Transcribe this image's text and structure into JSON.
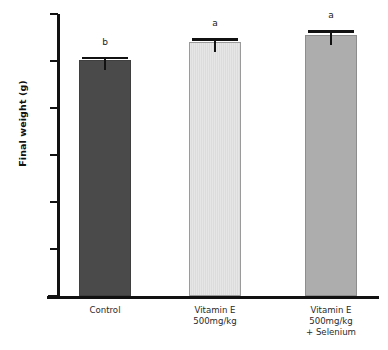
{
  "chart_data": {
    "type": "bar",
    "title": "",
    "xlabel": "",
    "ylabel": "Final weight (g)",
    "ylim": [
      0,
      120
    ],
    "yticks": [
      0,
      20,
      40,
      60,
      80,
      100,
      120
    ],
    "ytick_labels": [
      "0",
      "20",
      "40",
      "60",
      "80",
      "100",
      "120"
    ],
    "grid": false,
    "legend": "none",
    "categories": [
      "Control",
      "Vitamin E\n500mg/kg",
      "Vitamin E\n500mg/kg\n+ Selenium"
    ],
    "category_lines": [
      [
        "Control"
      ],
      [
        "Vitamin E",
        "500mg/kg"
      ],
      [
        "Vitamin E",
        "500mg/kg",
        "+ Selenium"
      ]
    ],
    "values": [
      100.3,
      108.2,
      111.0
    ],
    "errors": [
      1.6,
      1.5,
      2.0
    ],
    "annotations": [
      "b",
      "a",
      "a"
    ],
    "bar_colors": [
      "#4a4a4a",
      "#e2e2e2",
      "#adadad"
    ],
    "bar_edge_colors": [
      "#3f3f3f",
      "#9a9a9a",
      "#8d8d8d"
    ],
    "bar_fill_styles": [
      "solid",
      "vertical-hatch",
      "solid"
    ],
    "series": [
      {
        "name": "Final weight",
        "values": [
          100.3,
          108.2,
          111.0
        ],
        "errors": [
          1.6,
          1.5,
          2.0
        ]
      }
    ]
  },
  "axes": {
    "y_title": "Final weight (g)"
  }
}
